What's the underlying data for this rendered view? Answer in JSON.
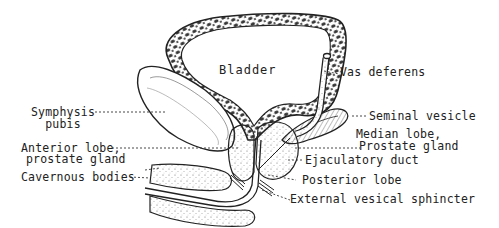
{
  "diagram": {
    "type": "anatomical-illustration",
    "colors": {
      "ink": "#222222",
      "background": "#ffffff",
      "stipple": "#555555"
    },
    "labels": {
      "bladder": "Bladder",
      "vas_deferens": "Vas deferens",
      "symphysis_line1": "Symphysis",
      "symphysis_line2": "pubis",
      "seminal_vesicle": "Seminal vesicle",
      "median_lobe_line1": "Median lobe,",
      "median_lobe_line2": "Prostate gland",
      "anterior_lobe_line1": "Anterior lobe,",
      "anterior_lobe_line2": "prostate gland",
      "ejaculatory_duct": "Ejaculatory duct",
      "cavernous_bodies": "Cavernous bodies",
      "posterior_lobe": "Posterior lobe",
      "external_sphincter": "External vesical sphincter"
    }
  }
}
